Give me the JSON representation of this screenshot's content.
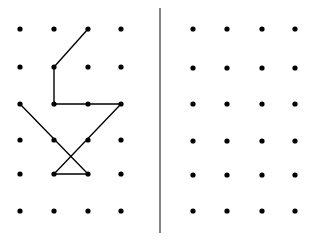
{
  "background": "#ffffff",
  "ink": "#000000",
  "divider": {
    "x": 160,
    "y1": 8,
    "y2": 233,
    "color": "#333333"
  },
  "left_grid": {
    "xs": [
      20,
      54,
      88,
      121
    ],
    "ys": [
      29,
      67,
      104,
      140,
      174,
      211
    ],
    "dot_radius": 2.6
  },
  "right_grid": {
    "xs": [
      193,
      227,
      262,
      295
    ],
    "ys": [
      29,
      68,
      104,
      141,
      175,
      211
    ],
    "dot_radius": 2.6
  },
  "figure": {
    "path_grid_points": [
      [
        2,
        0
      ],
      [
        1,
        1
      ],
      [
        1,
        2
      ],
      [
        3,
        2
      ],
      [
        1,
        4
      ],
      [
        2,
        4
      ],
      [
        0,
        2
      ]
    ]
  }
}
